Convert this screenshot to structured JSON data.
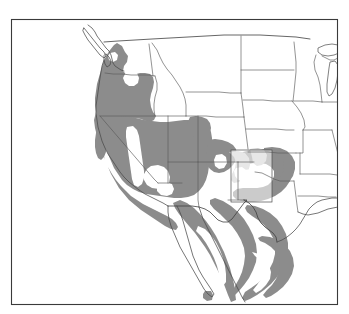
{
  "figure": {
    "type": "range-map",
    "width": 349,
    "height": 314,
    "background_color": "#ffffff",
    "frame": {
      "visible": true,
      "color": "#3a3a3a",
      "stroke_width": 1.1,
      "x": 11,
      "y": 19,
      "width": 327,
      "height": 286
    }
  },
  "legend_colors": {
    "range_primary": "#8c8c8c",
    "range_secondary": "#c9c9c9",
    "unshaded": "#ffffff",
    "state_border": "#5a5a5a",
    "country_border": "#3f3f3f",
    "coastline": "#4a4a4a"
  },
  "map": {
    "projection_region": "Western United States and Northwestern Mexico",
    "shaded_description": "Gray shaded polygons indicate distribution range",
    "unshaded_description": "White interior areas indicate gaps in range",
    "features": {
      "coastline": "Pacific coast from British Columbia through Baja California, Gulf of California, Gulf of Mexico",
      "state_boundaries": "Contiguous United States state outlines",
      "country_boundary": "United States - Mexico border",
      "lakes": "Great Lakes at eastern edge, Puget Sound inlets"
    },
    "highlight_box": {
      "present": true,
      "description": "Translucent rectangular inset overlay over eastern New Mexico and Texas panhandle",
      "x": 231,
      "y": 150,
      "width": 41,
      "height": 52
    },
    "range_gaps": [
      {
        "name": "columbia-basin-gap",
        "region": "Eastern Washington"
      },
      {
        "name": "central-valley-gap",
        "region": "California Central Valley"
      },
      {
        "name": "mojave-gap",
        "region": "Southern Nevada / Mojave"
      },
      {
        "name": "san-joaquin-gap",
        "region": "Southern California interior"
      },
      {
        "name": "coastal-plain-gap",
        "region": "Gulf coastal plain"
      }
    ]
  }
}
